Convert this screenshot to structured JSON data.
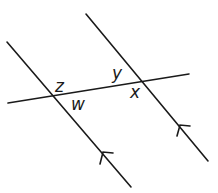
{
  "diagram": {
    "stroke_color": "#1a1a1a",
    "labels": {
      "z": "z",
      "w": "w",
      "y": "y",
      "x": "x"
    },
    "lines": [
      {
        "name": "left-parallel-line",
        "x1": 7,
        "y1": 42,
        "x2": 131,
        "y2": 187
      },
      {
        "name": "right-parallel-line",
        "x1": 86,
        "y1": 14,
        "x2": 208,
        "y2": 161
      },
      {
        "name": "transversal-line",
        "x1": 8,
        "y1": 103,
        "x2": 189,
        "y2": 74
      }
    ],
    "parallel_marks": "arrowheads pointing up-left on both parallel lines"
  }
}
